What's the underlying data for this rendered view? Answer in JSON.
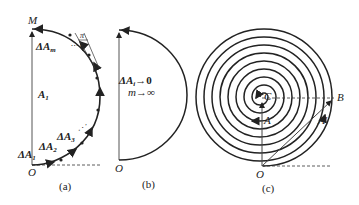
{
  "panels": {
    "a": {
      "caption": "(a)",
      "label_M": "M",
      "label_O": "O",
      "label_A1": "A",
      "label_A1_sub": "1",
      "label_dA1": "ΔA",
      "label_dA1_sub": "1",
      "label_dA2": "ΔA",
      "label_dA2_sub": "2",
      "label_dA3": "ΔA",
      "label_dA3_sub": "3",
      "label_dAm": "ΔA",
      "label_dAm_sub": "m",
      "angle_num": "π",
      "angle_den": "m"
    },
    "b": {
      "caption": "(b)",
      "label_O": "O",
      "limit_1": "ΔA",
      "limit_1_sub": "i",
      "limit_1_rhs": "→0",
      "limit_2": "m→∞"
    },
    "c": {
      "caption": "(c)",
      "label_C": "C",
      "label_A": "A",
      "label_A_prime": "A'",
      "label_B": "B",
      "label_O": "O"
    }
  }
}
